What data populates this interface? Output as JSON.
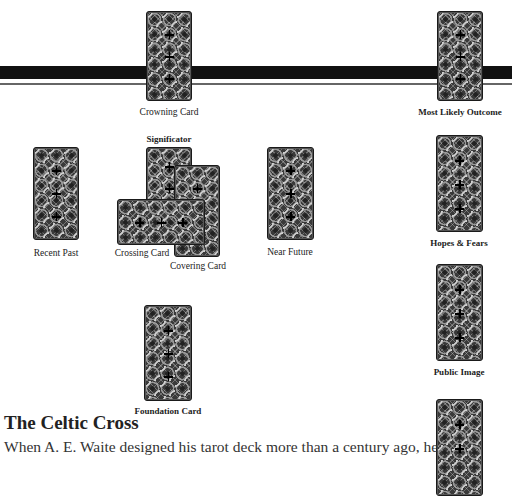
{
  "cards": [
    {
      "id": "crowning",
      "label": "Crowning Card",
      "orientation": "vertical"
    },
    {
      "id": "most-likely-outcome",
      "label": "Most Likely Outcome",
      "orientation": "vertical"
    },
    {
      "id": "significator",
      "label": "Significator",
      "orientation": "vertical"
    },
    {
      "id": "recent-past",
      "label": "Recent Past",
      "orientation": "vertical"
    },
    {
      "id": "covering",
      "label": "Covering Card",
      "orientation": "vertical"
    },
    {
      "id": "crossing",
      "label": "Crossing Card",
      "orientation": "horizontal"
    },
    {
      "id": "near-future",
      "label": "Near Future",
      "orientation": "vertical"
    },
    {
      "id": "hopes-fears",
      "label": "Hopes & Fears",
      "orientation": "vertical"
    },
    {
      "id": "public-image",
      "label": "Public Image",
      "orientation": "vertical"
    },
    {
      "id": "foundation",
      "label": "Foundation Card",
      "orientation": "vertical"
    },
    {
      "id": "self",
      "label": "",
      "orientation": "vertical"
    }
  ],
  "article": {
    "title": "The Celtic Cross",
    "body": "When A. E. Waite designed his tarot deck more than a century ago, he"
  }
}
